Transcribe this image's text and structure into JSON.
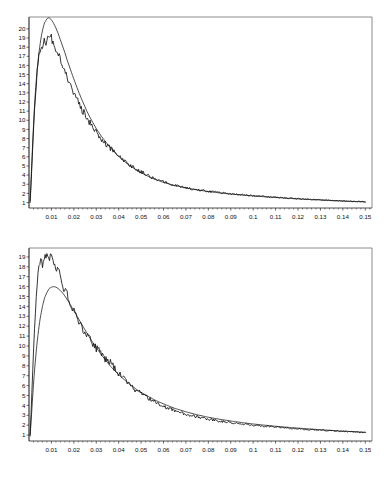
{
  "figure": {
    "caption": ""
  },
  "chart_data": [
    {
      "id": "top",
      "type": "line",
      "title": "",
      "xlabel": "",
      "ylabel": "",
      "grid": false,
      "legend": "none",
      "xlim": [
        0.0,
        0.153
      ],
      "ylim": [
        0.4,
        21.3
      ],
      "xticks": [
        0.01,
        0.02,
        0.03,
        0.04,
        0.05,
        0.06,
        0.07,
        0.08,
        0.09,
        0.1,
        0.11,
        0.12,
        0.13,
        0.14,
        0.15
      ],
      "xticklabels": [
        "0.01",
        "0.02",
        "0.03",
        "0.04",
        "0.05",
        "0.06",
        "0.07",
        "0.08",
        "0.09",
        "0.1",
        "0.11",
        "0.12",
        "0.13",
        "0.14",
        "0.15"
      ],
      "yticks": [
        1,
        2,
        3,
        4,
        5,
        6,
        7,
        8,
        9,
        10,
        11,
        12,
        13,
        14,
        15,
        16,
        17,
        18,
        19,
        20
      ],
      "yticklabels": [
        "1",
        "2",
        "3",
        "4",
        "5",
        "6",
        "7",
        "8",
        "9",
        "10",
        "11",
        "12",
        "13",
        "14",
        "15",
        "16",
        "17",
        "18",
        "19",
        "20"
      ],
      "series": [
        {
          "name": "fitted",
          "style": "smooth",
          "x": [
            0.0005,
            0.001,
            0.0015,
            0.002,
            0.0025,
            0.003,
            0.0035,
            0.004,
            0.0045,
            0.005,
            0.0055,
            0.006,
            0.0065,
            0.007,
            0.0075,
            0.008,
            0.0085,
            0.009,
            0.0095,
            0.01,
            0.0105,
            0.011,
            0.012,
            0.013,
            0.014,
            0.015,
            0.016,
            0.017,
            0.018,
            0.019,
            0.02,
            0.022,
            0.024,
            0.026,
            0.028,
            0.03,
            0.032,
            0.034,
            0.036,
            0.038,
            0.04,
            0.044,
            0.048,
            0.052,
            0.056,
            0.06,
            0.065,
            0.07,
            0.075,
            0.08,
            0.085,
            0.09,
            0.095,
            0.1,
            0.105,
            0.11,
            0.115,
            0.12,
            0.125,
            0.13,
            0.135,
            0.14,
            0.145,
            0.15
          ],
          "y": [
            1.2,
            3.9,
            6.8,
            9.4,
            11.7,
            13.6,
            15.1,
            16.4,
            17.5,
            18.4,
            19.2,
            19.8,
            20.3,
            20.7,
            20.9,
            21.1,
            21.2,
            21.2,
            21.1,
            21.0,
            20.8,
            20.6,
            20.1,
            19.5,
            18.8,
            18.1,
            17.4,
            16.6,
            15.9,
            15.2,
            14.5,
            13.2,
            12.0,
            10.9,
            9.95,
            9.1,
            8.35,
            7.7,
            7.1,
            6.55,
            6.05,
            5.2,
            4.55,
            4.0,
            3.55,
            3.2,
            2.85,
            2.6,
            2.38,
            2.2,
            2.05,
            1.92,
            1.82,
            1.72,
            1.63,
            1.55,
            1.47,
            1.4,
            1.33,
            1.27,
            1.21,
            1.16,
            1.11,
            1.07
          ]
        },
        {
          "name": "empirical",
          "style": "noisy",
          "x": [
            0.0005,
            0.001,
            0.0015,
            0.002,
            0.0025,
            0.003,
            0.0035,
            0.004,
            0.0045,
            0.005,
            0.0055,
            0.006,
            0.0065,
            0.007,
            0.0075,
            0.008,
            0.0085,
            0.009,
            0.0095,
            0.01,
            0.0105,
            0.011,
            0.012,
            0.013,
            0.014,
            0.015,
            0.016,
            0.017,
            0.018,
            0.019,
            0.02,
            0.022,
            0.024,
            0.026,
            0.028,
            0.03,
            0.032,
            0.034,
            0.036,
            0.038,
            0.04,
            0.044,
            0.048,
            0.052,
            0.056,
            0.06,
            0.065,
            0.07,
            0.075,
            0.08,
            0.085,
            0.09,
            0.095,
            0.1,
            0.105,
            0.11,
            0.115,
            0.12,
            0.125,
            0.13,
            0.135,
            0.14,
            0.145,
            0.15
          ],
          "y": [
            1.0,
            3.4,
            6.2,
            8.9,
            11.3,
            13.2,
            14.8,
            16.1,
            17.2,
            17.9,
            18.3,
            18.1,
            18.6,
            18.9,
            18.5,
            18.8,
            19.2,
            19.1,
            19.3,
            19.0,
            18.7,
            18.3,
            17.6,
            17.3,
            16.5,
            15.9,
            15.4,
            14.7,
            14.2,
            13.6,
            13.1,
            12.0,
            11.0,
            10.2,
            9.4,
            8.7,
            8.1,
            7.5,
            7.0,
            6.5,
            6.1,
            5.3,
            4.6,
            4.1,
            3.6,
            3.25,
            2.9,
            2.62,
            2.4,
            2.22,
            2.08,
            1.95,
            1.84,
            1.74,
            1.65,
            1.57,
            1.49,
            1.42,
            1.35,
            1.29,
            1.23,
            1.18,
            1.13,
            1.08
          ]
        }
      ]
    },
    {
      "id": "bottom",
      "type": "line",
      "title": "",
      "xlabel": "",
      "ylabel": "",
      "grid": false,
      "legend": "none",
      "xlim": [
        0.0,
        0.153
      ],
      "ylim": [
        0.4,
        19.9
      ],
      "xticks": [
        0.01,
        0.02,
        0.03,
        0.04,
        0.05,
        0.06,
        0.07,
        0.08,
        0.09,
        0.1,
        0.11,
        0.12,
        0.13,
        0.14,
        0.15
      ],
      "xticklabels": [
        "0.01",
        "0.02",
        "0.03",
        "0.04",
        "0.05",
        "0.06",
        "0.07",
        "0.08",
        "0.09",
        "0.1",
        "0.11",
        "0.12",
        "0.13",
        "0.14",
        "0.15"
      ],
      "yticks": [
        1,
        2,
        3,
        4,
        5,
        6,
        7,
        8,
        9,
        10,
        11,
        12,
        13,
        14,
        15,
        16,
        17,
        18,
        19
      ],
      "yticklabels": [
        "1",
        "2",
        "3",
        "4",
        "5",
        "6",
        "7",
        "8",
        "9",
        "10",
        "11",
        "12",
        "13",
        "14",
        "15",
        "16",
        "17",
        "18",
        "19"
      ],
      "series": [
        {
          "name": "fitted",
          "style": "smooth",
          "x": [
            0.0005,
            0.001,
            0.0015,
            0.002,
            0.0025,
            0.003,
            0.0035,
            0.004,
            0.0045,
            0.005,
            0.006,
            0.007,
            0.008,
            0.009,
            0.01,
            0.011,
            0.012,
            0.013,
            0.014,
            0.015,
            0.016,
            0.017,
            0.018,
            0.019,
            0.02,
            0.022,
            0.024,
            0.026,
            0.028,
            0.03,
            0.032,
            0.034,
            0.036,
            0.038,
            0.04,
            0.044,
            0.048,
            0.052,
            0.056,
            0.06,
            0.065,
            0.07,
            0.075,
            0.08,
            0.085,
            0.09,
            0.095,
            0.1,
            0.105,
            0.11,
            0.115,
            0.12,
            0.125,
            0.13,
            0.135,
            0.14,
            0.145,
            0.15
          ],
          "y": [
            0.9,
            2.6,
            4.4,
            6.1,
            7.6,
            8.9,
            10.1,
            11.1,
            12.0,
            12.8,
            14.0,
            14.9,
            15.4,
            15.8,
            15.95,
            16.0,
            15.95,
            15.8,
            15.6,
            15.35,
            15.05,
            14.7,
            14.35,
            13.95,
            13.55,
            12.8,
            12.0,
            11.25,
            10.5,
            9.85,
            9.2,
            8.6,
            8.05,
            7.55,
            7.1,
            6.3,
            5.6,
            5.05,
            4.55,
            4.15,
            3.7,
            3.35,
            3.05,
            2.8,
            2.6,
            2.42,
            2.26,
            2.12,
            2.0,
            1.89,
            1.79,
            1.7,
            1.62,
            1.54,
            1.47,
            1.4,
            1.34,
            1.28
          ]
        },
        {
          "name": "empirical",
          "style": "noisy",
          "x": [
            0.0005,
            0.001,
            0.0015,
            0.002,
            0.0025,
            0.003,
            0.0035,
            0.004,
            0.0045,
            0.005,
            0.006,
            0.007,
            0.008,
            0.009,
            0.01,
            0.011,
            0.012,
            0.013,
            0.014,
            0.015,
            0.016,
            0.017,
            0.018,
            0.019,
            0.02,
            0.022,
            0.024,
            0.026,
            0.028,
            0.03,
            0.032,
            0.034,
            0.036,
            0.038,
            0.04,
            0.044,
            0.048,
            0.052,
            0.056,
            0.06,
            0.065,
            0.07,
            0.075,
            0.08,
            0.085,
            0.09,
            0.095,
            0.1,
            0.105,
            0.11,
            0.115,
            0.12,
            0.125,
            0.13,
            0.135,
            0.14,
            0.145,
            0.15
          ],
          "y": [
            1.0,
            3.6,
            6.6,
            9.4,
            11.9,
            14.0,
            15.7,
            17.0,
            18.0,
            18.6,
            18.3,
            18.9,
            19.3,
            18.6,
            19.2,
            18.3,
            18.0,
            17.7,
            17.1,
            16.1,
            15.6,
            15.3,
            14.5,
            14.0,
            13.5,
            12.6,
            11.8,
            11.1,
            10.4,
            9.8,
            9.4,
            8.7,
            8.5,
            7.7,
            7.3,
            6.3,
            5.5,
            4.9,
            4.4,
            3.9,
            3.45,
            3.1,
            2.85,
            2.6,
            2.42,
            2.26,
            2.12,
            2.0,
            1.9,
            1.8,
            1.71,
            1.63,
            1.56,
            1.5,
            1.44,
            1.38,
            1.32,
            1.26
          ]
        }
      ]
    }
  ]
}
